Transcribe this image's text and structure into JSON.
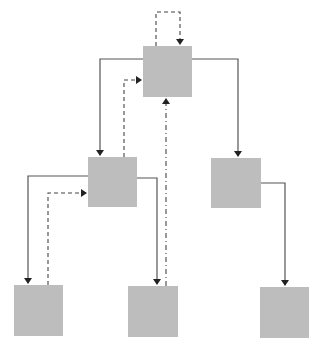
{
  "diagram": {
    "type": "tree",
    "node_color": "#bdbdbd",
    "edge_color": "#555555",
    "nodes": [
      {
        "id": "root",
        "x": 143,
        "y": 46,
        "w": 49,
        "h": 51
      },
      {
        "id": "mid-left",
        "x": 88,
        "y": 157,
        "w": 49,
        "h": 50
      },
      {
        "id": "mid-right",
        "x": 211,
        "y": 158,
        "w": 50,
        "h": 50
      },
      {
        "id": "leaf-left",
        "x": 14,
        "y": 285,
        "w": 49,
        "h": 51
      },
      {
        "id": "leaf-middle",
        "x": 128,
        "y": 286,
        "w": 50,
        "h": 51
      },
      {
        "id": "leaf-right",
        "x": 260,
        "y": 287,
        "w": 49,
        "h": 51
      }
    ],
    "edges": [
      {
        "from": "root",
        "to": "mid-left",
        "style": "solid"
      },
      {
        "from": "root",
        "to": "mid-right",
        "style": "solid"
      },
      {
        "from": "mid-left",
        "to": "leaf-left",
        "style": "solid"
      },
      {
        "from": "mid-left",
        "to": "leaf-middle",
        "style": "solid"
      },
      {
        "from": "mid-right",
        "to": "leaf-right",
        "style": "solid"
      },
      {
        "from": "root",
        "to": "root",
        "style": "dashed"
      },
      {
        "from": "mid-left",
        "to": "root",
        "style": "dashed"
      },
      {
        "from": "leaf-left",
        "to": "mid-left",
        "style": "dashed"
      },
      {
        "from": "leaf-middle",
        "to": "root",
        "style": "dash-dot"
      }
    ]
  }
}
